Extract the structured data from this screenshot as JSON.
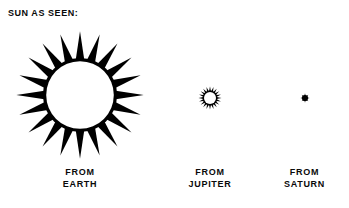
{
  "figure": {
    "title": "SUN AS SEEN:",
    "background_color": "#ffffff",
    "ink_color": "#000000",
    "width": 349,
    "height": 208
  },
  "views": [
    {
      "id": "earth",
      "icon": "spiky-sun-icon",
      "caption_line1": "FROM",
      "caption_line2": "EARTH",
      "apparent_diameter_px": 127,
      "disc_diameter_px": 70,
      "ray_count": 20
    },
    {
      "id": "jupiter",
      "icon": "spiky-sun-icon",
      "caption_line1": "FROM",
      "caption_line2": "JUPITER",
      "apparent_diameter_px": 23,
      "disc_diameter_px": 13,
      "ray_count": 20
    },
    {
      "id": "saturn",
      "icon": "star-burst-icon",
      "caption_line1": "FROM",
      "caption_line2": "SATURN",
      "apparent_diameter_px": 9,
      "disc_diameter_px": 4,
      "ray_count": 8
    }
  ]
}
